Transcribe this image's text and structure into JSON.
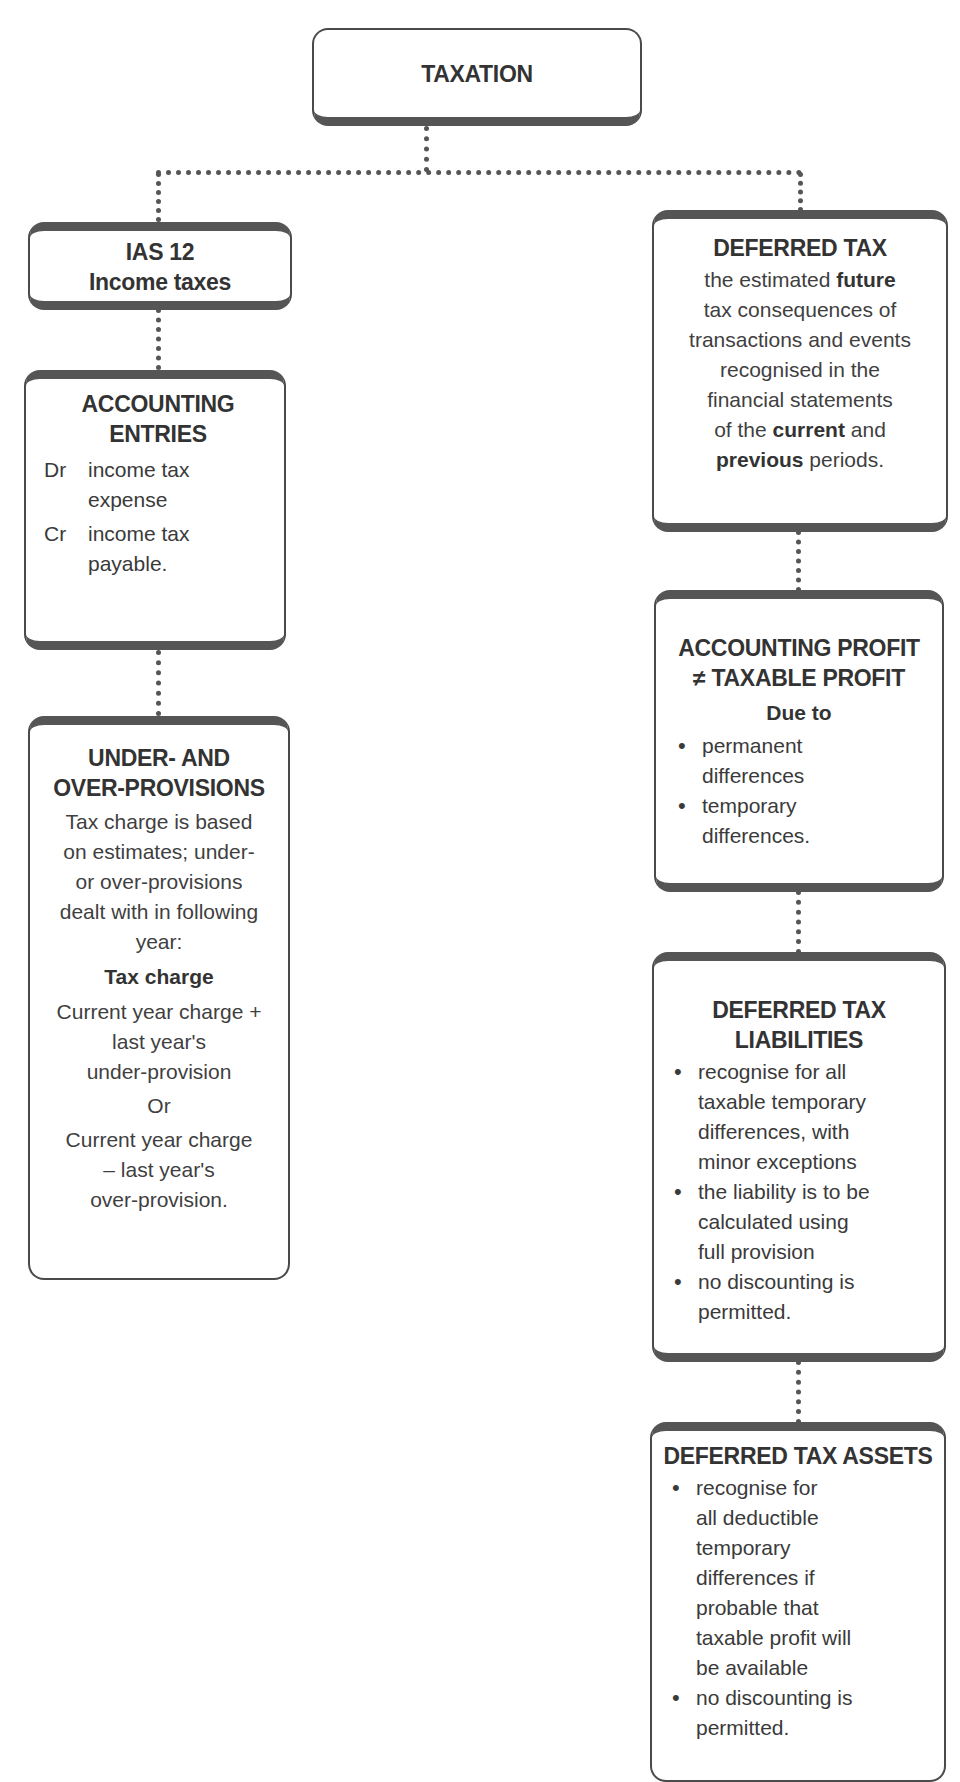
{
  "root": {
    "title": "TAXATION"
  },
  "left": {
    "ias": {
      "line1": "IAS 12",
      "line2": "Income taxes"
    },
    "entries": {
      "title_line1": "ACCOUNTING",
      "title_line2": "ENTRIES",
      "items": [
        {
          "key": "Dr",
          "line1": "income tax",
          "line2": "expense"
        },
        {
          "key": "Cr",
          "line1": "income tax",
          "line2": "payable."
        }
      ]
    },
    "provisions": {
      "title_line1": "UNDER- AND",
      "title_line2": "OVER-PROVISIONS",
      "intro": [
        "Tax charge is based",
        "on estimates; under-",
        "or over-provisions",
        "dealt with in following",
        "year:"
      ],
      "subheading": "Tax charge",
      "option1": [
        "Current year charge +",
        "last year's",
        "under-provision"
      ],
      "or_label": "Or",
      "option2": [
        "Current year  charge",
        "– last year's",
        "over-provision."
      ]
    }
  },
  "right": {
    "deferred": {
      "title": "DEFERRED TAX",
      "p1": "the estimated ",
      "b1": "future",
      "p2": "tax consequences of",
      "p3": "transactions and events",
      "p4": "recognised in the",
      "p5": "financial statements",
      "p6a": "of the ",
      "b2": "current",
      "p6b": " and",
      "b3": "previous",
      "p7": " periods."
    },
    "profit": {
      "title_line1": "ACCOUNTING PROFIT",
      "title_line2": "≠ TAXABLE PROFIT",
      "subheading": "Due to",
      "bullets": [
        [
          "permanent",
          "differences"
        ],
        [
          "temporary",
          "differences."
        ]
      ]
    },
    "liabilities": {
      "title_line1": "DEFERRED TAX",
      "title_line2": "LIABILITIES",
      "bullets": [
        [
          "recognise for all",
          "taxable temporary",
          "differences, with",
          "minor exceptions"
        ],
        [
          "the liability is to be",
          "calculated using",
          "full provision"
        ],
        [
          "no discounting is",
          "permitted."
        ]
      ]
    },
    "assets": {
      "title": "DEFERRED TAX ASSETS",
      "bullets": [
        [
          "recognise for",
          "all deductible",
          "temporary",
          "differences if",
          "probable that",
          "taxable profit will",
          "be available"
        ],
        [
          "no discounting is",
          "permitted."
        ]
      ]
    }
  }
}
